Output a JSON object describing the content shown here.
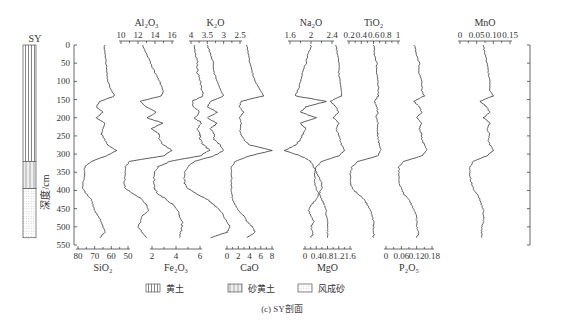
{
  "figure": {
    "caption": "(c) SY剖面",
    "column_title": "SY",
    "depth_axis": {
      "label": "深度/cm",
      "ticks": [
        0,
        50,
        100,
        150,
        200,
        250,
        300,
        350,
        400,
        450,
        500,
        550
      ],
      "range": [
        0,
        550
      ]
    },
    "legend": [
      {
        "label": "黄土",
        "pattern": "vertical-lines"
      },
      {
        "label": "砂黄土",
        "pattern": "sparse-vertical-lines"
      },
      {
        "label": "风成砂",
        "pattern": "dots"
      }
    ],
    "strata": [
      {
        "unit": "黄土",
        "top": 0,
        "bottom": 320
      },
      {
        "unit": "砂黄土",
        "top": 320,
        "bottom": 395
      },
      {
        "unit": "风成砂",
        "top": 395,
        "bottom": 530
      }
    ]
  },
  "chart_data": {
    "type": "line",
    "title": "(c) SY剖面",
    "ylabel": "深度/cm",
    "ylim": [
      0,
      550
    ],
    "y_inverted": true,
    "depth": [
      0,
      25,
      50,
      75,
      100,
      125,
      140,
      155,
      170,
      185,
      200,
      215,
      230,
      245,
      260,
      275,
      290,
      305,
      320,
      335,
      350,
      365,
      380,
      395,
      410,
      425,
      440,
      455,
      470,
      485,
      500,
      515,
      530
    ],
    "series": [
      {
        "name": "SiO2",
        "position": "bottom",
        "axis_ticks": [
          80,
          70,
          60,
          50
        ],
        "xlim": [
          80,
          50
        ],
        "reversed": true,
        "values": [
          64,
          64,
          63,
          63,
          62,
          60,
          58,
          67,
          69,
          65,
          69,
          64,
          65,
          66,
          64,
          62,
          57,
          63,
          72,
          76,
          76,
          76,
          77,
          77,
          75,
          72,
          71,
          70,
          68,
          66,
          65,
          64,
          67
        ]
      },
      {
        "name": "Al2O3",
        "position": "top",
        "axis_ticks": [
          10,
          12,
          14,
          16
        ],
        "xlim": [
          10,
          16
        ],
        "values": [
          12.5,
          13,
          13.5,
          14,
          14.5,
          15,
          14.8,
          12.2,
          13,
          14.2,
          13,
          15,
          13.5,
          14.5,
          14.5,
          15,
          16,
          15,
          11,
          10.5,
          10.5,
          10.5,
          10.3,
          10.5,
          11.5,
          12.5,
          13,
          13.3,
          12.5,
          12.3,
          12,
          12.5,
          13
        ]
      },
      {
        "name": "Fe2O3",
        "position": "bottom",
        "axis_ticks": [
          2,
          4,
          6
        ],
        "xlim": [
          0.5,
          7
        ],
        "values": [
          5.5,
          5.6,
          5.8,
          5.8,
          6,
          6.2,
          6.3,
          5.3,
          5.5,
          6,
          5.5,
          6.2,
          5.7,
          6,
          6,
          6.3,
          6.8,
          6,
          3.5,
          2.5,
          2.2,
          2.2,
          2.1,
          2.2,
          2.5,
          3.2,
          3.8,
          4.2,
          4.3,
          4.5,
          4.5,
          4.4,
          4.3
        ]
      },
      {
        "name": "K2O",
        "position": "top",
        "axis_ticks": [
          4.0,
          3.5,
          3.0,
          2.5
        ],
        "xlim": [
          4.2,
          2.4
        ],
        "reversed": true,
        "values": [
          3.5,
          3.4,
          3.3,
          3.3,
          3.2,
          3.1,
          3.0,
          3.4,
          3.5,
          3.2,
          3.5,
          3.2,
          3.4,
          3.3,
          3.3,
          3.1,
          3.0,
          3.3,
          3.9,
          4.1,
          4.2,
          4.2,
          4.2,
          4.1,
          3.8,
          3.5,
          3.3,
          3.1,
          3.0,
          2.9,
          2.8,
          2.9,
          3.4
        ]
      },
      {
        "name": "CaO",
        "position": "bottom",
        "axis_ticks": [
          0,
          2,
          4,
          6,
          8
        ],
        "xlim": [
          0,
          8
        ],
        "values": [
          3.5,
          3.8,
          4,
          4.5,
          5,
          6,
          6.5,
          2.5,
          2.2,
          3,
          2.2,
          2.5,
          2.3,
          2.5,
          3,
          4,
          8,
          4,
          1.5,
          0.8,
          0.8,
          0.8,
          0.8,
          0.8,
          0.8,
          1,
          1.5,
          2,
          3,
          3.5,
          4.5,
          5,
          3.5
        ]
      },
      {
        "name": "Na2O",
        "position": "top",
        "axis_ticks": [
          1.6,
          2.0,
          2.4
        ],
        "xlim": [
          1.4,
          2.6
        ],
        "values": [
          2.0,
          1.95,
          1.9,
          1.85,
          1.8,
          1.75,
          1.7,
          2.3,
          1.9,
          1.8,
          2.1,
          1.8,
          1.9,
          1.85,
          1.8,
          1.7,
          1.5,
          1.8,
          2.0,
          2.05,
          2.1,
          2.15,
          2.2,
          2.2,
          2.15,
          2.1,
          2.0,
          1.95,
          2.0,
          2.05,
          2.0,
          2.05,
          2.0
        ]
      },
      {
        "name": "MgO",
        "position": "bottom",
        "axis_ticks": [
          0.0,
          0.4,
          0.8,
          1.2,
          1.6
        ],
        "xlim": [
          0,
          1.6
        ],
        "values": [
          1.1,
          1.15,
          1.2,
          1.2,
          1.25,
          1.3,
          1.3,
          0.9,
          1.1,
          1.2,
          1.0,
          1.2,
          1.1,
          1.2,
          1.25,
          1.3,
          1.4,
          1.2,
          0.6,
          0.4,
          0.35,
          0.35,
          0.35,
          0.4,
          0.5,
          0.6,
          0.7,
          0.75,
          0.75,
          0.8,
          0.8,
          0.8,
          0.8
        ]
      },
      {
        "name": "TiO2",
        "position": "top",
        "axis_ticks": [
          0.2,
          0.4,
          0.6,
          0.8,
          1.0
        ],
        "xlim": [
          0.1,
          1.1
        ],
        "values": [
          0.6,
          0.62,
          0.65,
          0.66,
          0.67,
          0.68,
          0.68,
          0.62,
          0.65,
          0.67,
          0.64,
          0.68,
          0.66,
          0.67,
          0.68,
          0.69,
          0.72,
          0.67,
          0.35,
          0.25,
          0.22,
          0.22,
          0.22,
          0.25,
          0.35,
          0.45,
          0.5,
          0.55,
          0.58,
          0.6,
          0.6,
          0.61,
          0.6
        ]
      },
      {
        "name": "P2O5",
        "position": "bottom",
        "axis_ticks": [
          0.0,
          0.06,
          0.12,
          0.18
        ],
        "xlim": [
          0,
          0.19
        ],
        "values": [
          0.11,
          0.12,
          0.13,
          0.13,
          0.14,
          0.14,
          0.15,
          0.11,
          0.13,
          0.14,
          0.12,
          0.14,
          0.13,
          0.14,
          0.14,
          0.15,
          0.16,
          0.14,
          0.07,
          0.05,
          0.05,
          0.05,
          0.05,
          0.06,
          0.07,
          0.09,
          0.1,
          0.11,
          0.12,
          0.12,
          0.12,
          0.13,
          0.12
        ]
      },
      {
        "name": "MnO",
        "position": "top",
        "axis_ticks": [
          0.0,
          0.05,
          0.1,
          0.15
        ],
        "xlim": [
          0,
          0.15
        ],
        "values": [
          0.07,
          0.075,
          0.08,
          0.085,
          0.09,
          0.09,
          0.1,
          0.06,
          0.08,
          0.09,
          0.07,
          0.09,
          0.08,
          0.09,
          0.085,
          0.09,
          0.1,
          0.08,
          0.04,
          0.03,
          0.03,
          0.03,
          0.035,
          0.04,
          0.05,
          0.06,
          0.065,
          0.07,
          0.07,
          0.07,
          0.065,
          0.065,
          0.065
        ]
      }
    ],
    "legend": [
      "黄土",
      "砂黄土",
      "风成砂"
    ],
    "grid": false
  }
}
